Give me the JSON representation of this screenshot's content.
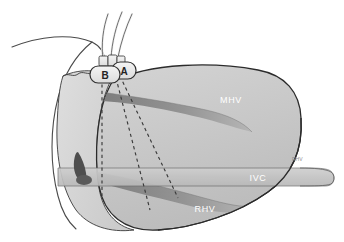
{
  "figure": {
    "width": 344,
    "height": 242,
    "background": "#ffffff"
  },
  "colors": {
    "liver_body": "#c8c8c8",
    "liver_body_light": "#d6d6d6",
    "liver_outline": "#2b2b2b",
    "vein_dark": "#8a8a8a",
    "vein_mid": "#9c9c9c",
    "ivc_band": "#c2c2c2",
    "port_fill": "#ebebeb",
    "port_outline": "#3a3a3a",
    "catheter_stroke": "#555555",
    "dashed_line": "#3a3a3a",
    "chest_wall_outline": "#4a4a4a",
    "marker_dark": "#4e4e4e",
    "label_text_white": "#ffffff",
    "label_text_dark": "#222222"
  },
  "labels": {
    "mhv": "MHV",
    "ivc": "IVC",
    "rhv": "RHV",
    "port_a": "A",
    "port_b": "B",
    "small_marker": "RHV"
  },
  "structures": [
    {
      "name": "middle-hepatic-vein",
      "abbr": "MHV",
      "label": "MHV"
    },
    {
      "name": "inferior-vena-cava",
      "abbr": "IVC",
      "label": "IVC"
    },
    {
      "name": "right-hepatic-vein",
      "abbr": "RHV",
      "label": "RHV"
    }
  ],
  "ports": [
    {
      "name": "port-a",
      "label": "A"
    },
    {
      "name": "port-b",
      "label": "B"
    }
  ],
  "catheters": {
    "count": 3,
    "name": "catheter-tubes"
  },
  "trajectories": {
    "count": 3,
    "name": "dashed-needle-trajectories"
  }
}
